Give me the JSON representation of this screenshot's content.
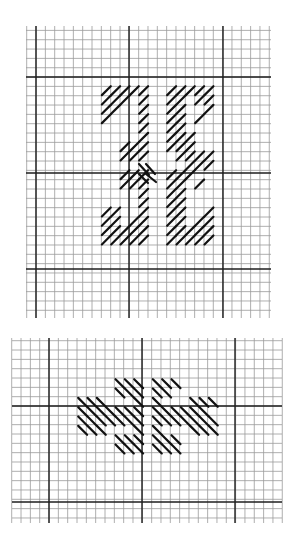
{
  "figure": {
    "colors": {
      "background": "#ffffff",
      "grid_fine": "#9a9a9a",
      "grid_heavy": "#1e1e1e",
      "stitch": "#111111"
    }
  },
  "diagrams": [
    {
      "name": "top-diagram",
      "bounds": {
        "x0": 26,
        "y0": 26,
        "x1": 271,
        "y1": 318
      },
      "cell": 9.33,
      "fine_origin": {
        "x": 26.7,
        "y": 30.4
      },
      "heavy_x": [
        36,
        129,
        223
      ],
      "heavy_y": [
        77,
        173,
        269
      ],
      "stitch_direction": "forward",
      "cells": [
        [
          2,
          0
        ],
        [
          3,
          0
        ],
        [
          4,
          0
        ],
        [
          5,
          0
        ],
        [
          6,
          0
        ],
        [
          9,
          0
        ],
        [
          10,
          0
        ],
        [
          11,
          0
        ],
        [
          12,
          0
        ],
        [
          13,
          0
        ],
        [
          2,
          1
        ],
        [
          3,
          1
        ],
        [
          4,
          1
        ],
        [
          6,
          1
        ],
        [
          9,
          1
        ],
        [
          10,
          1
        ],
        [
          12,
          1
        ],
        [
          13,
          1
        ],
        [
          2,
          2
        ],
        [
          3,
          2
        ],
        [
          6,
          2
        ],
        [
          9,
          2
        ],
        [
          10,
          2
        ],
        [
          13,
          2
        ],
        [
          2,
          3
        ],
        [
          6,
          3
        ],
        [
          9,
          3
        ],
        [
          10,
          3
        ],
        [
          12,
          3
        ],
        [
          6,
          4
        ],
        [
          9,
          4
        ],
        [
          10,
          4
        ],
        [
          6,
          5
        ],
        [
          9,
          5
        ],
        [
          10,
          5
        ],
        [
          11,
          5
        ],
        [
          4,
          6
        ],
        [
          5,
          6
        ],
        [
          6,
          6
        ],
        [
          9,
          6
        ],
        [
          10,
          6
        ],
        [
          11,
          6
        ],
        [
          4,
          7
        ],
        [
          5,
          7
        ],
        [
          6,
          7
        ],
        [
          10,
          7
        ],
        [
          11,
          7
        ],
        [
          12,
          7
        ],
        [
          13,
          7
        ],
        [
          11,
          8
        ],
        [
          12,
          8
        ],
        [
          13,
          8
        ],
        [
          4,
          9
        ],
        [
          5,
          9
        ],
        [
          6,
          9
        ],
        [
          9,
          9
        ],
        [
          10,
          9
        ],
        [
          11,
          9
        ],
        [
          4,
          10
        ],
        [
          5,
          10
        ],
        [
          6,
          10
        ],
        [
          9,
          10
        ],
        [
          10,
          10
        ],
        [
          12,
          10
        ],
        [
          6,
          11
        ],
        [
          9,
          11
        ],
        [
          10,
          11
        ],
        [
          6,
          12
        ],
        [
          9,
          12
        ],
        [
          10,
          12
        ],
        [
          2,
          13
        ],
        [
          3,
          13
        ],
        [
          6,
          13
        ],
        [
          9,
          13
        ],
        [
          10,
          13
        ],
        [
          13,
          13
        ],
        [
          2,
          14
        ],
        [
          3,
          14
        ],
        [
          5,
          14
        ],
        [
          6,
          14
        ],
        [
          9,
          14
        ],
        [
          10,
          14
        ],
        [
          12,
          14
        ],
        [
          13,
          14
        ],
        [
          2,
          15
        ],
        [
          3,
          15
        ],
        [
          4,
          15
        ],
        [
          5,
          15
        ],
        [
          6,
          15
        ],
        [
          9,
          15
        ],
        [
          10,
          15
        ],
        [
          11,
          15
        ],
        [
          12,
          15
        ],
        [
          13,
          15
        ],
        [
          2,
          16
        ],
        [
          3,
          16
        ],
        [
          4,
          16
        ],
        [
          5,
          16
        ],
        [
          6,
          16
        ],
        [
          9,
          16
        ],
        [
          10,
          16
        ],
        [
          11,
          16
        ],
        [
          12,
          16
        ],
        [
          13,
          16
        ]
      ],
      "stitch_origin": {
        "x": 82,
        "y": 87
      },
      "cross_stitches": [
        {
          "x1": 139,
          "y1": 164,
          "x2": 149,
          "y2": 175
        },
        {
          "x1": 146,
          "y1": 164,
          "x2": 155,
          "y2": 174
        },
        {
          "x1": 139,
          "y1": 174,
          "x2": 148,
          "y2": 183
        },
        {
          "x1": 146,
          "y1": 174,
          "x2": 156,
          "y2": 182
        }
      ]
    },
    {
      "name": "bottom-diagram",
      "bounds": {
        "x0": 12,
        "y0": 338,
        "x1": 282,
        "y1": 523
      },
      "cell": 9.33,
      "fine_origin": {
        "x": 11.7,
        "y": 340.7
      },
      "heavy_x": [
        49,
        142,
        235
      ],
      "heavy_y": [
        406,
        502
      ],
      "stitch_direction": "backward",
      "cells": [
        [
          4,
          0
        ],
        [
          5,
          0
        ],
        [
          6,
          0
        ],
        [
          8,
          0
        ],
        [
          9,
          0
        ],
        [
          10,
          0
        ],
        [
          4,
          1
        ],
        [
          5,
          1
        ],
        [
          6,
          1
        ],
        [
          8,
          1
        ],
        [
          9,
          1
        ],
        [
          0,
          2
        ],
        [
          1,
          2
        ],
        [
          2,
          2
        ],
        [
          6,
          2
        ],
        [
          8,
          2
        ],
        [
          12,
          2
        ],
        [
          13,
          2
        ],
        [
          14,
          2
        ],
        [
          0,
          3
        ],
        [
          1,
          3
        ],
        [
          2,
          3
        ],
        [
          3,
          3
        ],
        [
          4,
          3
        ],
        [
          5,
          3
        ],
        [
          6,
          3
        ],
        [
          8,
          3
        ],
        [
          9,
          3
        ],
        [
          10,
          3
        ],
        [
          11,
          3
        ],
        [
          12,
          3
        ],
        [
          13,
          3
        ],
        [
          0,
          4
        ],
        [
          1,
          4
        ],
        [
          2,
          4
        ],
        [
          3,
          4
        ],
        [
          4,
          4
        ],
        [
          5,
          4
        ],
        [
          6,
          4
        ],
        [
          8,
          4
        ],
        [
          9,
          4
        ],
        [
          10,
          4
        ],
        [
          11,
          4
        ],
        [
          12,
          4
        ],
        [
          13,
          4
        ],
        [
          14,
          4
        ],
        [
          0,
          5
        ],
        [
          1,
          5
        ],
        [
          2,
          5
        ],
        [
          6,
          5
        ],
        [
          8,
          5
        ],
        [
          12,
          5
        ],
        [
          13,
          5
        ],
        [
          14,
          5
        ],
        [
          4,
          6
        ],
        [
          5,
          6
        ],
        [
          6,
          6
        ],
        [
          8,
          6
        ],
        [
          9,
          6
        ],
        [
          10,
          6
        ],
        [
          4,
          7
        ],
        [
          5,
          7
        ],
        [
          6,
          7
        ],
        [
          8,
          7
        ],
        [
          9,
          7
        ],
        [
          10,
          7
        ]
      ],
      "stitch_origin": {
        "x": 77,
        "y": 378
      }
    }
  ]
}
